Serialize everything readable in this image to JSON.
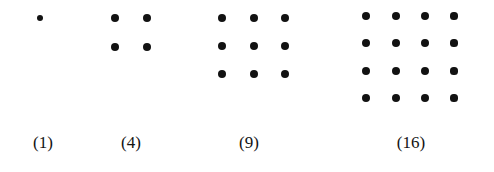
{
  "figure": {
    "type": "figurate-number-diagram",
    "background_color": "#ffffff",
    "dot_color": "#121212",
    "label_color": "#131313",
    "width": 494,
    "height": 172
  },
  "chart_data": {
    "type": "scatter",
    "title": "",
    "xlabel": "",
    "ylabel": "",
    "categories": [
      "(1)",
      "(4)",
      "(9)",
      "(16)"
    ],
    "values": [
      1,
      4,
      9,
      16
    ],
    "series": [
      {
        "name": "square-number-1",
        "side": 1,
        "dot_count": 1
      },
      {
        "name": "square-number-4",
        "side": 2,
        "dot_count": 4
      },
      {
        "name": "square-number-9",
        "side": 3,
        "dot_count": 9
      },
      {
        "name": "square-number-16",
        "side": 4,
        "dot_count": 16
      }
    ],
    "grid": false,
    "legend": "none"
  },
  "groups": [
    {
      "id": "group-1",
      "label": "(1)",
      "count": 1,
      "side": 1,
      "label_x": 43,
      "label_y": 134,
      "dot_size": 7,
      "dots": [
        {
          "cx": 40,
          "cy": 18,
          "r": 3.4
        }
      ]
    },
    {
      "id": "group-4",
      "label": "(4)",
      "count": 4,
      "side": 2,
      "label_x": 131,
      "label_y": 134,
      "dot_size": 8,
      "dots": [
        {
          "cx": 115,
          "cy": 18,
          "r": 4.1
        },
        {
          "cx": 147,
          "cy": 18,
          "r": 4.1
        },
        {
          "cx": 115,
          "cy": 47,
          "r": 4.1
        },
        {
          "cx": 147,
          "cy": 47,
          "r": 4.1
        }
      ]
    },
    {
      "id": "group-9",
      "label": "(9)",
      "count": 9,
      "side": 3,
      "label_x": 249,
      "label_y": 134,
      "dot_size": 8,
      "dots": [
        {
          "cx": 222,
          "cy": 18,
          "r": 4.1
        },
        {
          "cx": 254,
          "cy": 18,
          "r": 4.1
        },
        {
          "cx": 285,
          "cy": 18,
          "r": 4.1
        },
        {
          "cx": 222,
          "cy": 46,
          "r": 4.1
        },
        {
          "cx": 254,
          "cy": 46,
          "r": 4.1
        },
        {
          "cx": 285,
          "cy": 46,
          "r": 4.1
        },
        {
          "cx": 222,
          "cy": 74,
          "r": 4.1
        },
        {
          "cx": 254,
          "cy": 74,
          "r": 4.1
        },
        {
          "cx": 285,
          "cy": 74,
          "r": 4.1
        }
      ]
    },
    {
      "id": "group-16",
      "label": "(16)",
      "count": 16,
      "side": 4,
      "label_x": 411,
      "label_y": 134,
      "dot_size": 8,
      "dots": [
        {
          "cx": 366,
          "cy": 16,
          "r": 4.1
        },
        {
          "cx": 396,
          "cy": 16,
          "r": 4.1
        },
        {
          "cx": 425,
          "cy": 16,
          "r": 4.1
        },
        {
          "cx": 454,
          "cy": 16,
          "r": 3.6
        },
        {
          "cx": 366,
          "cy": 43,
          "r": 4.1
        },
        {
          "cx": 396,
          "cy": 43,
          "r": 4.1
        },
        {
          "cx": 425,
          "cy": 43,
          "r": 4.1
        },
        {
          "cx": 454,
          "cy": 43,
          "r": 3.6
        },
        {
          "cx": 366,
          "cy": 71,
          "r": 4.1
        },
        {
          "cx": 396,
          "cy": 71,
          "r": 4.1
        },
        {
          "cx": 425,
          "cy": 71,
          "r": 4.1
        },
        {
          "cx": 454,
          "cy": 71,
          "r": 3.6
        },
        {
          "cx": 366,
          "cy": 98,
          "r": 4.1
        },
        {
          "cx": 396,
          "cy": 98,
          "r": 4.1
        },
        {
          "cx": 425,
          "cy": 98,
          "r": 4.1
        },
        {
          "cx": 454,
          "cy": 98,
          "r": 3.6
        }
      ]
    }
  ]
}
